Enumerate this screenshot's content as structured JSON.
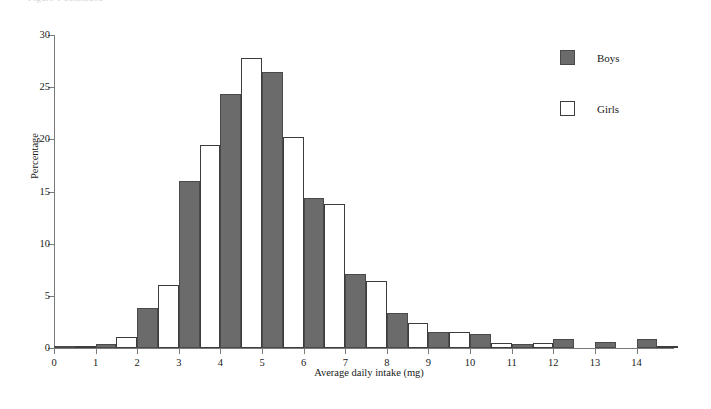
{
  "figure": {
    "top_caption_fragment": "Figure 1 continued",
    "ylabel": "Percentage",
    "xlabel": "Average daily intake (mg)"
  },
  "legend": {
    "position": "top-right",
    "entries": [
      {
        "label": "Boys",
        "swatch": "filled-gray-square",
        "color": "#6b6b6b"
      },
      {
        "label": "Girls",
        "swatch": "open-white-square",
        "color": "#ffffff"
      }
    ]
  },
  "chart_data": {
    "type": "bar",
    "title": "",
    "subtitle": "",
    "xlabel": "Average daily intake (mg)",
    "ylabel": "Percentage",
    "xlim": [
      0,
      14.9
    ],
    "ylim": [
      0,
      30
    ],
    "yticks": [
      0,
      5,
      10,
      15,
      20,
      25,
      30
    ],
    "xticks": [
      0,
      1,
      2,
      3,
      4,
      5,
      6,
      7,
      8,
      9,
      10,
      11,
      12,
      13,
      14
    ],
    "grid": false,
    "legend_position": "top-right",
    "bin_width": 1,
    "categories": [
      "0-1",
      "1-2",
      "2-3",
      "3-4",
      "4-5",
      "5-6",
      "6-7",
      "7-8",
      "8-9",
      "9-10",
      "10-11",
      "11-12",
      "12-13",
      "13-14",
      "14-15"
    ],
    "bin_starts": [
      0,
      1,
      2,
      3,
      4,
      5,
      6,
      7,
      8,
      9,
      10,
      11,
      12,
      13,
      14
    ],
    "series": [
      {
        "name": "Boys",
        "color": "#6b6b6b",
        "values": [
          0.2,
          0.4,
          3.8,
          16.0,
          24.3,
          26.5,
          14.4,
          7.1,
          3.4,
          1.5,
          1.3,
          0.4,
          0.9,
          0.6,
          0.9
        ]
      },
      {
        "name": "Girls",
        "color": "#ffffff",
        "values": [
          0.2,
          1.1,
          6.0,
          19.5,
          27.8,
          20.2,
          13.8,
          6.4,
          2.4,
          1.5,
          0.5,
          0.5,
          0.0,
          0.0,
          0.2
        ]
      }
    ]
  }
}
